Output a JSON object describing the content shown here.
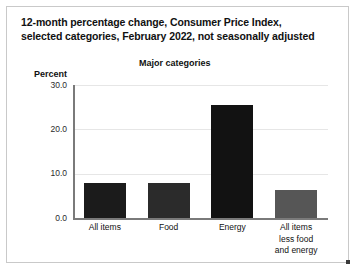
{
  "figure": {
    "title_lines": [
      "12-month percentage change, Consumer Price Index,",
      "selected categories, February 2022, not seasonally adjusted"
    ],
    "subtitle": "Major categories",
    "ylabel": "Percent"
  },
  "chart_data": {
    "type": "bar",
    "title": "12-month percentage change, Consumer Price Index, selected categories, February 2022, not seasonally adjusted",
    "subtitle": "Major categories",
    "xlabel": "",
    "ylabel": "Percent",
    "ylim": [
      0,
      30
    ],
    "yticks": [
      0,
      10,
      20,
      30
    ],
    "ytick_labels": [
      "0.0",
      "10.0",
      "20.0",
      "30.0"
    ],
    "grid": true,
    "legend": "none",
    "categories": [
      "All items",
      "Food",
      "Energy",
      "All items less food and energy"
    ],
    "category_label_lines": [
      [
        "All items"
      ],
      [
        "Food"
      ],
      [
        "Energy"
      ],
      [
        "All items",
        "less food",
        "and energy"
      ]
    ],
    "values": [
      7.9,
      7.9,
      25.6,
      6.4
    ],
    "bar_colors": [
      "#1b1b1b",
      "#2b2b2b",
      "#121212",
      "#565656"
    ]
  },
  "colors": {
    "axis": "#7a7a7a",
    "grid": "#e6e6e6",
    "frame": "#c9c9c9",
    "text": "#111111"
  }
}
